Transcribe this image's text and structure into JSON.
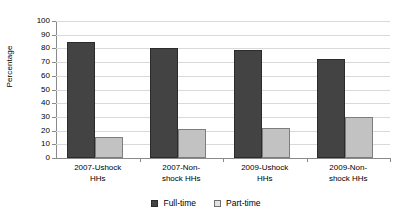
{
  "chart_data": {
    "type": "bar",
    "title": "",
    "xlabel": "",
    "ylabel": "Percentage",
    "ylim": [
      0,
      100
    ],
    "ytick_step": 10,
    "yticks": [
      "100",
      "90",
      "80",
      "70",
      "60",
      "50",
      "40",
      "30",
      "20",
      "10",
      "0"
    ],
    "grid": true,
    "legend_position": "bottom",
    "categories": [
      "2007-Ushock HHs",
      "2007-Non-shock HHs",
      "2009-Ushock HHs",
      "2009-Non-shock HHs"
    ],
    "categories_lines": [
      [
        "2007-Ushock",
        "HHs"
      ],
      [
        "2007-Non-",
        "shock HHs"
      ],
      [
        "2009-Ushock",
        "HHs"
      ],
      [
        "2009-Non-",
        "shock HHs"
      ]
    ],
    "series": [
      {
        "name": "Full-time",
        "color": "#434343",
        "values": [
          85,
          80,
          79,
          72
        ]
      },
      {
        "name": "Part-time",
        "color": "#c2c2c2",
        "values": [
          15,
          21,
          22,
          30
        ]
      }
    ]
  },
  "legend": {
    "items": [
      {
        "label": "Full-time",
        "swatch": "dark-square-swatch"
      },
      {
        "label": "Part-time",
        "swatch": "light-square-swatch"
      }
    ]
  },
  "axis": {
    "y_title": "Percentage"
  }
}
